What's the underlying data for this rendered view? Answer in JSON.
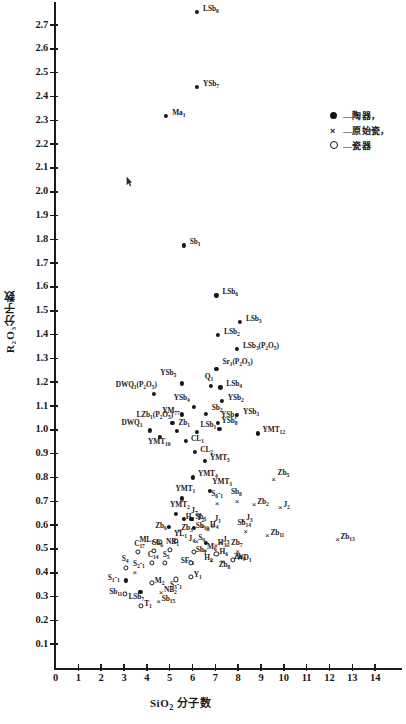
{
  "chart_data": {
    "type": "scatter",
    "title": "",
    "xlabel": "SiO2 分子数",
    "ylabel": "R2O3 分子数",
    "xlim": [
      0,
      15
    ],
    "ylim": [
      0,
      2.78
    ],
    "xticks": [
      0,
      1,
      2,
      3,
      4,
      5,
      6,
      7,
      8,
      9,
      10,
      11,
      12,
      13,
      14
    ],
    "yticks": [
      0.1,
      0.2,
      0.3,
      0.4,
      0.5,
      0.6,
      0.7,
      0.8,
      0.9,
      1.0,
      1.1,
      1.2,
      1.3,
      1.4,
      1.5,
      1.6,
      1.7,
      1.8,
      1.9,
      2.0,
      2.1,
      2.2,
      2.3,
      2.4,
      2.5,
      2.6,
      2.7
    ],
    "grid": false,
    "legend_position": "top-right",
    "series": [
      {
        "name": "陶器",
        "marker": "filled-circle",
        "points": [
          {
            "label": "LSb8",
            "x": 6.2,
            "y": 2.755,
            "lx": 6,
            "ly": -3
          },
          {
            "label": "YSb7",
            "x": 6.2,
            "y": 2.44,
            "lx": 6,
            "ly": -3
          },
          {
            "label": "Ma1",
            "x": 4.85,
            "y": 2.318,
            "lx": 6,
            "ly": -3
          },
          {
            "label": "Sb1",
            "x": 5.62,
            "y": 1.775,
            "lx": 6,
            "ly": -3
          },
          {
            "label": "LSb6",
            "x": 7.05,
            "y": 1.565,
            "lx": 6,
            "ly": -3
          },
          {
            "label": "LSb3",
            "x": 8.08,
            "y": 1.455,
            "lx": 6,
            "ly": -3
          },
          {
            "label": "LSb2",
            "x": 7.12,
            "y": 1.4,
            "lx": 6,
            "ly": -3
          },
          {
            "label": "LSb3(P2O5)",
            "x": 7.95,
            "y": 1.34,
            "lx": 6,
            "ly": -3
          },
          {
            "label": "Sr1(P2O5)",
            "x": 7.05,
            "y": 1.255,
            "lx": 6,
            "ly": -7
          },
          {
            "label": "YSb5",
            "x": 5.55,
            "y": 1.195,
            "lx": -22,
            "ly": -10
          },
          {
            "label": "Q1",
            "x": 6.8,
            "y": 1.185,
            "lx": -6,
            "ly": -9
          },
          {
            "label": "LSb4",
            "x": 7.22,
            "y": 1.178,
            "lx": 6,
            "ly": -3
          },
          {
            "label": "DWQ1(P2O5)",
            "x": 4.3,
            "y": 1.15,
            "lx": -38,
            "ly": -9
          },
          {
            "label": "YSb2",
            "x": 7.28,
            "y": 1.122,
            "lx": 6,
            "ly": -3
          },
          {
            "label": "YSb4",
            "x": 6.05,
            "y": 1.098,
            "lx": -20,
            "ly": -9
          },
          {
            "label": "YM77",
            "x": 5.55,
            "y": 1.065,
            "lx": -20,
            "ly": -3
          },
          {
            "label": "Sb2",
            "x": 6.58,
            "y": 1.068,
            "lx": 6,
            "ly": -6
          },
          {
            "label": "YSb3",
            "x": 7.95,
            "y": 1.062,
            "lx": 6,
            "ly": -3
          },
          {
            "label": "LZb1(P2O5)",
            "x": 5.12,
            "y": 1.028,
            "lx": -36,
            "ly": -8
          },
          {
            "label": "YSb1",
            "x": 7.12,
            "y": 1.03,
            "lx": 3,
            "ly": -8
          },
          {
            "label": "DWQ1",
            "x": 4.12,
            "y": 0.998,
            "lx": -28,
            "ly": -7
          },
          {
            "label": "Zb1",
            "x": 5.3,
            "y": 0.995,
            "lx": 2,
            "ly": -8
          },
          {
            "label": "LSb1",
            "x": 6.18,
            "y": 0.99,
            "lx": 4,
            "ly": -7
          },
          {
            "label": "YSb8",
            "x": 7.18,
            "y": 1.005,
            "lx": 2,
            "ly": -8
          },
          {
            "label": "YMT12",
            "x": 8.85,
            "y": 0.985,
            "lx": 5,
            "ly": -3
          },
          {
            "label": "YMT10",
            "x": 4.58,
            "y": 0.97,
            "lx": -12,
            "ly": 5
          },
          {
            "label": "CL1",
            "x": 5.72,
            "y": 0.952,
            "lx": 5,
            "ly": -2
          },
          {
            "label": "CL2",
            "x": 6.12,
            "y": 0.908,
            "lx": 5,
            "ly": -2
          },
          {
            "label": "YMT5",
            "x": 6.55,
            "y": 0.87,
            "lx": 5,
            "ly": -3
          },
          {
            "label": "YMT4",
            "x": 6.02,
            "y": 0.8,
            "lx": 5,
            "ly": -3
          },
          {
            "label": "YMT3",
            "x": 6.78,
            "y": 0.745,
            "lx": 2,
            "ly": -9
          },
          {
            "label": "YMT1",
            "x": 5.52,
            "y": 0.712,
            "lx": -6,
            "ly": -9
          },
          {
            "label": "YMT2",
            "x": 5.28,
            "y": 0.648,
            "lx": -6,
            "ly": -9
          },
          {
            "label": "H1",
            "x": 5.62,
            "y": 0.625,
            "lx": 2,
            "ly": -2
          },
          {
            "label": "Sb5",
            "x": 5.95,
            "y": 0.625,
            "lx": 4,
            "ly": -2
          },
          {
            "label": "Zb6",
            "x": 4.98,
            "y": 0.592,
            "lx": -14,
            "ly": -1
          },
          {
            "label": "S9",
            "x": 6.6,
            "y": 0.525,
            "lx": -8,
            "ly": -5
          },
          {
            "label": "Sb10",
            "x": 6.05,
            "y": 0.588,
            "lx": 2,
            "ly": -2
          },
          {
            "label": "S1-1",
            "x": 3.08,
            "y": 0.368,
            "lx": -18,
            "ly": -2
          },
          {
            "label": "LSb7",
            "x": 3.72,
            "y": 0.318,
            "lx": -12,
            "ly": 5
          }
        ]
      },
      {
        "name": "原始瓷",
        "marker": "x",
        "points": [
          {
            "label": "Zb5",
            "x": 9.55,
            "y": 0.795,
            "lx": 4,
            "ly": -6
          },
          {
            "label": "S6-1",
            "x": 7.08,
            "y": 0.695,
            "lx": -6,
            "ly": -9
          },
          {
            "label": "Sb8",
            "x": 7.95,
            "y": 0.7,
            "lx": -6,
            "ly": -9
          },
          {
            "label": "Zb2",
            "x": 8.7,
            "y": 0.688,
            "lx": 3,
            "ly": -2
          },
          {
            "label": "J2",
            "x": 9.85,
            "y": 0.678,
            "lx": 3,
            "ly": -2
          },
          {
            "label": "J7",
            "x": 5.95,
            "y": 0.625,
            "lx": 0,
            "ly": -8
          },
          {
            "label": "J3",
            "x": 8.22,
            "y": 0.622,
            "lx": 3,
            "ly": -2
          },
          {
            "label": "T2",
            "x": 6.45,
            "y": 0.598,
            "lx": -6,
            "ly": -8
          },
          {
            "label": "J1",
            "x": 6.88,
            "y": 0.595,
            "lx": 2,
            "ly": -7
          },
          {
            "label": "Zb3",
            "x": 5.42,
            "y": 0.58,
            "lx": 2,
            "ly": -2
          },
          {
            "label": "H4",
            "x": 6.68,
            "y": 0.585,
            "lx": 2,
            "ly": -4
          },
          {
            "label": "Sb14",
            "x": 8.32,
            "y": 0.575,
            "lx": -8,
            "ly": -8
          },
          {
            "label": "Zb11",
            "x": 9.28,
            "y": 0.56,
            "lx": 3,
            "ly": -2
          },
          {
            "label": "Zb13",
            "x": 12.35,
            "y": 0.54,
            "lx": 3,
            "ly": -2
          },
          {
            "label": "J4",
            "x": 6.18,
            "y": 0.532,
            "lx": -8,
            "ly": -2
          },
          {
            "label": "J5",
            "x": 7.25,
            "y": 0.528,
            "lx": 2,
            "ly": -2
          },
          {
            "label": "H3",
            "x": 7.02,
            "y": 0.518,
            "lx": 2,
            "ly": -2
          },
          {
            "label": "Zb7",
            "x": 7.55,
            "y": 0.518,
            "lx": 3,
            "ly": -2
          },
          {
            "label": "Zb9",
            "x": 7.98,
            "y": 0.492,
            "lx": -4,
            "ly": 6
          },
          {
            "label": "M6",
            "x": 6.55,
            "y": 0.495,
            "lx": 2,
            "ly": -3
          },
          {
            "label": "H2",
            "x": 6.82,
            "y": 0.455,
            "lx": -7,
            "ly": -2
          },
          {
            "label": "Zb8",
            "x": 7.32,
            "y": 0.448,
            "lx": -4,
            "ly": 4
          },
          {
            "label": "NB2",
            "x": 4.62,
            "y": 0.318,
            "lx": 3,
            "ly": -2
          },
          {
            "label": "Sb15",
            "x": 4.52,
            "y": 0.282,
            "lx": 3,
            "ly": -2
          },
          {
            "label": "S2-1",
            "x": 3.48,
            "y": 0.402,
            "lx": -2,
            "ly": -8
          }
        ]
      },
      {
        "name": "瓷器",
        "marker": "open-circle",
        "points": [
          {
            "label": "ML1",
            "x": 4.55,
            "y": 0.528,
            "lx": -20,
            "ly": -2
          },
          {
            "label": "YL1",
            "x": 5.28,
            "y": 0.535,
            "lx": -2,
            "ly": -7
          },
          {
            "label": "C17",
            "x": 3.62,
            "y": 0.488,
            "lx": -4,
            "ly": -8
          },
          {
            "label": "Sb6",
            "x": 4.32,
            "y": 0.492,
            "lx": -2,
            "ly": -8
          },
          {
            "label": "NB1",
            "x": 5.02,
            "y": 0.495,
            "lx": -4,
            "ly": -8
          },
          {
            "label": "Sh1",
            "x": 6.05,
            "y": 0.488,
            "lx": 2,
            "ly": -2
          },
          {
            "label": "H6",
            "x": 7.05,
            "y": 0.478,
            "lx": 3,
            "ly": -2
          },
          {
            "label": "WD1",
            "x": 7.78,
            "y": 0.455,
            "lx": 3,
            "ly": -2
          },
          {
            "label": "C14",
            "x": 4.22,
            "y": 0.442,
            "lx": -4,
            "ly": -8
          },
          {
            "label": "S5",
            "x": 4.78,
            "y": 0.442,
            "lx": -2,
            "ly": -8
          },
          {
            "label": "SF-1",
            "x": 5.92,
            "y": 0.442,
            "lx": -10,
            "ly": -2
          },
          {
            "label": "S4",
            "x": 3.08,
            "y": 0.422,
            "lx": -4,
            "ly": -9
          },
          {
            "label": "S3-1",
            "x": 5.28,
            "y": 0.372,
            "lx": -6,
            "ly": 6
          },
          {
            "label": "Y1",
            "x": 5.92,
            "y": 0.382,
            "lx": 3,
            "ly": -2
          },
          {
            "label": "M2",
            "x": 4.22,
            "y": 0.358,
            "lx": 3,
            "ly": -2
          },
          {
            "label": "Sb11",
            "x": 3.05,
            "y": 0.312,
            "lx": -16,
            "ly": -2
          },
          {
            "label": "T1",
            "x": 3.75,
            "y": 0.262,
            "lx": 3,
            "ly": -2
          }
        ]
      }
    ]
  },
  "legend": {
    "items": [
      {
        "mark": "filled-circle-icon",
        "text": "—陶器，"
      },
      {
        "mark": "x-icon",
        "text": "—原始瓷，"
      },
      {
        "mark": "open-circle-icon",
        "text": "—瓷器"
      }
    ]
  },
  "axes": {
    "y_title": "R₂O₃分子数",
    "x_title_main": "SiO",
    "x_title_sub": "2",
    "x_title_tail": " 分子数",
    "x_ticklabels": [
      "0",
      "1",
      "2",
      "3",
      "4",
      "5",
      "6",
      "7",
      "8",
      "9",
      "10",
      "11",
      "12",
      "13",
      "14"
    ],
    "y_ticklabels": [
      "0.1",
      "0.2",
      "0.3",
      "0.4",
      "0.5",
      "0.6",
      "0.7",
      "0.8",
      "0.9",
      "1.0",
      "1.1",
      "1.2",
      "1.3",
      "1.4",
      "1.5",
      "1.6",
      "1.7",
      "1.8",
      "1.9",
      "2.0",
      "2.1",
      "2.2",
      "2.3",
      "2.4",
      "2.5",
      "2.6",
      "2.7"
    ]
  }
}
